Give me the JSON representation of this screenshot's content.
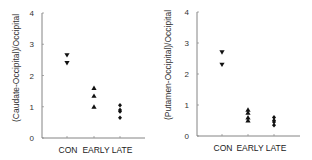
{
  "chart_data": [
    {
      "type": "scatter",
      "title": "",
      "xlabel": "",
      "ylabel": "(Caudate-Occipital)/Occipital",
      "categories": [
        "CON",
        "EARLY",
        "LATE"
      ],
      "ylim": [
        0,
        4
      ],
      "yticks": [
        "0",
        "1",
        "2",
        "3",
        "4"
      ],
      "grid": false,
      "legend": "none",
      "series": [
        {
          "name": "CON",
          "marker": "triangle-down",
          "values": [
            2.65,
            2.4
          ]
        },
        {
          "name": "EARLY",
          "marker": "triangle-up",
          "values": [
            1.6,
            1.35,
            1.0
          ]
        },
        {
          "name": "LATE",
          "marker": "diamond",
          "values": [
            1.05,
            0.9,
            0.85,
            0.65
          ]
        }
      ]
    },
    {
      "type": "scatter",
      "title": "",
      "xlabel": "",
      "ylabel": "(Putamen-Occipital)/Occipital",
      "categories": [
        "CON",
        "EARLY",
        "LATE"
      ],
      "ylim": [
        0,
        4
      ],
      "yticks": [
        "0",
        "1",
        "2",
        "3",
        "4"
      ],
      "grid": false,
      "legend": "none",
      "series": [
        {
          "name": "CON",
          "marker": "triangle-down",
          "values": [
            2.7,
            2.3
          ]
        },
        {
          "name": "EARLY",
          "marker": "triangle-up",
          "values": [
            0.85,
            0.75,
            0.6,
            0.5
          ]
        },
        {
          "name": "LATE",
          "marker": "diamond",
          "values": [
            0.6,
            0.5,
            0.45,
            0.35
          ]
        }
      ]
    }
  ],
  "panels": [
    {
      "ylabel": "(Caudate-Occipital)/Occipital"
    },
    {
      "ylabel": "(Putamen-Occipital)/Occipital"
    }
  ]
}
